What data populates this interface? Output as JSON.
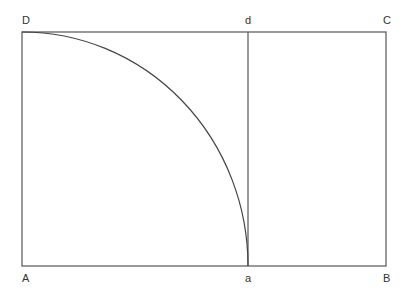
{
  "diagram": {
    "colors": {
      "stroke": "#555555",
      "arc": "#444444",
      "label": "#333333",
      "background": "#ffffff"
    },
    "points": {
      "A": {
        "label": "A",
        "x": 22,
        "y": 266
      },
      "B": {
        "label": "B",
        "x": 386,
        "y": 266
      },
      "C": {
        "label": "C",
        "x": 386,
        "y": 32
      },
      "D": {
        "label": "D",
        "x": 22,
        "y": 32
      },
      "a": {
        "label": "a",
        "x": 248,
        "y": 266
      },
      "d": {
        "label": "d",
        "x": 248,
        "y": 32
      }
    },
    "segments": [
      {
        "name": "rectangle-ABCD"
      },
      {
        "name": "line-ad",
        "from": "a",
        "to": "d"
      }
    ],
    "arc": {
      "name": "arc-Da",
      "from": "D",
      "to": "a",
      "center": "A"
    }
  }
}
